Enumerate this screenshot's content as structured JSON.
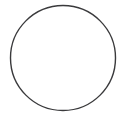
{
  "figure": {
    "title": "",
    "background_color": "#ffffff",
    "width": 126,
    "height": 119,
    "shapes": [
      {
        "name": "circle-outline",
        "type": "circle",
        "label": "",
        "center_x": 63,
        "center_y": 58,
        "radius": 52.5,
        "stroke_color": "#3a3a3c",
        "stroke_width": 1.4,
        "fill": "none"
      }
    ]
  }
}
